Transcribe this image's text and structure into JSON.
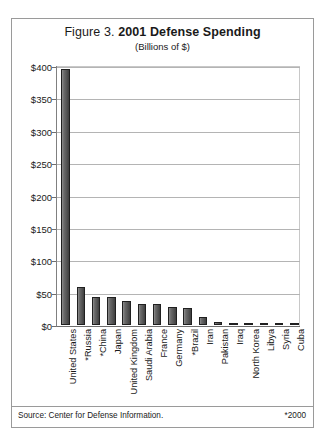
{
  "figure": {
    "title_prefix": "Figure 3.",
    "title_main": "2001 Defense Spending",
    "subtitle": "(Billions of $)",
    "source_note": "Source: Center for Defense Information.",
    "year_note": "*2000",
    "frame_color": "#9a9a9a",
    "bar_color": "#575757",
    "bar_outline_color": "#202020",
    "gridline_color": "#b4b4b4",
    "axis_color": "#6e6e6e",
    "text_color": "#1a1a1a"
  },
  "chart_data": {
    "type": "bar",
    "title": "Figure 3. 2001 Defense Spending",
    "subtitle": "(Billions of $)",
    "xlabel": "",
    "ylabel": "",
    "ylim": [
      0,
      400
    ],
    "yticks": [
      0,
      50,
      100,
      150,
      200,
      250,
      300,
      350,
      400
    ],
    "ytick_labels": [
      "$0",
      "$50",
      "$100",
      "$150",
      "$200",
      "$250",
      "$300",
      "$350",
      "$400"
    ],
    "grid": true,
    "legend": "none",
    "orientation": "vertical",
    "units": "Billions of US dollars",
    "footnote_marker": "*",
    "footnote_meaning": "*2000",
    "categories": [
      "United States",
      "*Russia",
      "*China",
      "Japan",
      "United Kingdom",
      "Saudi Arabia",
      "France",
      "Germany",
      "*Brazil",
      "Iran",
      "Pakistan",
      "Iraq",
      "North Korea",
      "Libya",
      "Syria",
      "Cuba"
    ],
    "values": [
      396,
      58,
      43,
      43,
      37,
      32,
      32,
      28,
      26,
      12,
      5,
      3,
      2,
      2,
      2,
      1
    ]
  }
}
